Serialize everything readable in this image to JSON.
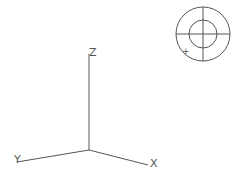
{
  "axes": {
    "x_label": "X",
    "y_label": "Y",
    "z_label": "Z"
  },
  "compass": {
    "marker": "+"
  },
  "colors": {
    "line": "#555555",
    "background": "#ffffff"
  }
}
